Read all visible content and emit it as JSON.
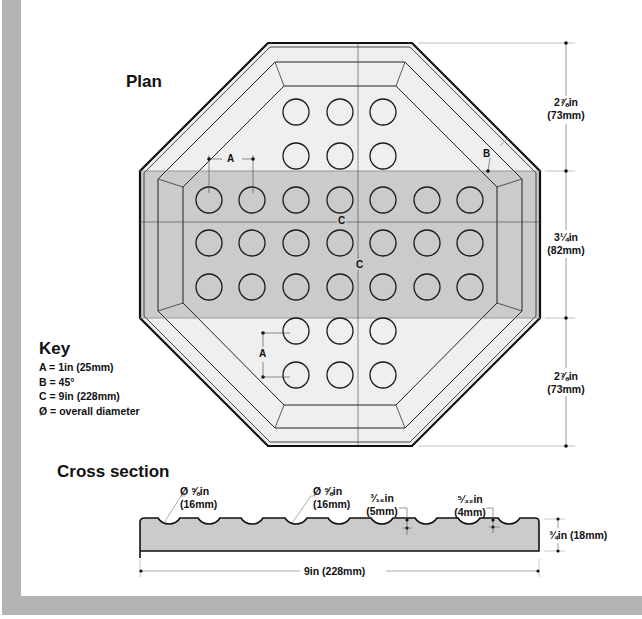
{
  "plan": {
    "title": "Plan",
    "labels": {
      "A": "A",
      "B": "B",
      "C_horizontal": "C",
      "C_vertical": "C"
    },
    "dimensions_right": [
      {
        "line1": "2⅞in",
        "line2": "(73mm)"
      },
      {
        "line1": "3¼in",
        "line2": "(82mm)"
      },
      {
        "line1": "2⅞in",
        "line2": "(73mm)"
      }
    ],
    "dots": {
      "columns_x": [
        209,
        252,
        296,
        340,
        383,
        427,
        470
      ],
      "rows": [
        {
          "y": 112,
          "cols": [
            2,
            3,
            4
          ]
        },
        {
          "y": 156,
          "cols": [
            2,
            3,
            4
          ]
        },
        {
          "y": 200,
          "cols": [
            0,
            1,
            2,
            3,
            4,
            5,
            6
          ]
        },
        {
          "y": 243,
          "cols": [
            0,
            1,
            2,
            3,
            4,
            5,
            6
          ]
        },
        {
          "y": 287,
          "cols": [
            0,
            1,
            2,
            3,
            4,
            5,
            6
          ]
        },
        {
          "y": 331,
          "cols": [
            2,
            3,
            4
          ]
        },
        {
          "y": 375,
          "cols": [
            2,
            3,
            4
          ]
        }
      ],
      "radius": 13
    }
  },
  "key": {
    "title": "Key",
    "items": [
      "A = 1in (25mm)",
      "B = 45°",
      "C = 9in (228mm)",
      "Ø = overall diameter"
    ]
  },
  "cross_section": {
    "title": "Cross section",
    "callouts": [
      {
        "line1": "Ø ⅝in",
        "line2": "(16mm)"
      },
      {
        "line1": "Ø ⅝in",
        "line2": "(16mm)"
      },
      {
        "line1": "³⁄₁₆in",
        "line2": "(5mm)"
      },
      {
        "line1": "⁵⁄₃₂in",
        "line2": "(4mm)"
      }
    ],
    "thickness": "¾in (18mm)",
    "width": "9in (228mm)"
  },
  "colors": {
    "frame": "#b3b3b3",
    "light_fill": "#efefef",
    "band_fill": "#cbcbcb",
    "line": "#1a1a1a"
  }
}
